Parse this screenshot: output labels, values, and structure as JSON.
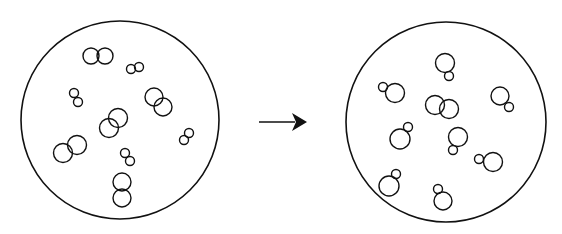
{
  "diagram": {
    "stroke_color": "#111111",
    "background": "#ffffff",
    "left_panel": {
      "name": "before",
      "boundary": {
        "cx": 120,
        "cy": 120,
        "r": 99
      },
      "pairs": [
        [
          {
            "cx": 91,
            "cy": 56,
            "r": 8
          },
          {
            "cx": 105,
            "cy": 56,
            "r": 8
          }
        ],
        [
          {
            "cx": 131,
            "cy": 69,
            "r": 4.5
          },
          {
            "cx": 139,
            "cy": 67,
            "r": 4.5
          }
        ],
        [
          {
            "cx": 74,
            "cy": 93,
            "r": 4.5
          },
          {
            "cx": 78,
            "cy": 102,
            "r": 4.5
          }
        ],
        [
          {
            "cx": 154,
            "cy": 97,
            "r": 9
          },
          {
            "cx": 163,
            "cy": 107,
            "r": 9
          }
        ],
        [
          {
            "cx": 118,
            "cy": 118,
            "r": 9.5
          },
          {
            "cx": 109,
            "cy": 128,
            "r": 9.5
          }
        ],
        [
          {
            "cx": 189,
            "cy": 133,
            "r": 4.5
          },
          {
            "cx": 184,
            "cy": 140,
            "r": 4.5
          }
        ],
        [
          {
            "cx": 77,
            "cy": 145,
            "r": 9.5
          },
          {
            "cx": 63,
            "cy": 153,
            "r": 9.5
          }
        ],
        [
          {
            "cx": 125,
            "cy": 153,
            "r": 4.5
          },
          {
            "cx": 130,
            "cy": 161,
            "r": 4.5
          }
        ],
        [
          {
            "cx": 122,
            "cy": 182,
            "r": 9
          },
          {
            "cx": 122,
            "cy": 198,
            "r": 9
          }
        ]
      ]
    },
    "arrow": {
      "x1": 259,
      "y1": 122,
      "x2": 307,
      "y2": 122,
      "direction": "right"
    },
    "right_panel": {
      "name": "after",
      "boundary": {
        "cx": 446,
        "cy": 122,
        "r": 100
      },
      "pairs": [
        [
          {
            "cx": 445,
            "cy": 63,
            "r": 9.5
          },
          {
            "cx": 449,
            "cy": 76,
            "r": 4.5
          }
        ],
        [
          {
            "cx": 383,
            "cy": 87,
            "r": 4.5
          },
          {
            "cx": 395,
            "cy": 93,
            "r": 9.5
          }
        ],
        [
          {
            "cx": 500,
            "cy": 96,
            "r": 9
          },
          {
            "cx": 509,
            "cy": 107,
            "r": 4.5
          }
        ],
        [
          {
            "cx": 435,
            "cy": 105,
            "r": 9.5
          },
          {
            "cx": 449,
            "cy": 109,
            "r": 9.5
          }
        ],
        [
          {
            "cx": 408,
            "cy": 127,
            "r": 4.5
          },
          {
            "cx": 400,
            "cy": 139,
            "r": 10
          }
        ],
        [
          {
            "cx": 458,
            "cy": 137,
            "r": 9.5
          },
          {
            "cx": 453,
            "cy": 150,
            "r": 4.5
          }
        ],
        [
          {
            "cx": 479,
            "cy": 159,
            "r": 4.5
          },
          {
            "cx": 493,
            "cy": 162,
            "r": 9.5
          }
        ],
        [
          {
            "cx": 396,
            "cy": 174,
            "r": 4.5
          },
          {
            "cx": 389,
            "cy": 186,
            "r": 10
          }
        ],
        [
          {
            "cx": 438,
            "cy": 189,
            "r": 4.5
          },
          {
            "cx": 443,
            "cy": 201,
            "r": 9
          }
        ]
      ]
    }
  }
}
